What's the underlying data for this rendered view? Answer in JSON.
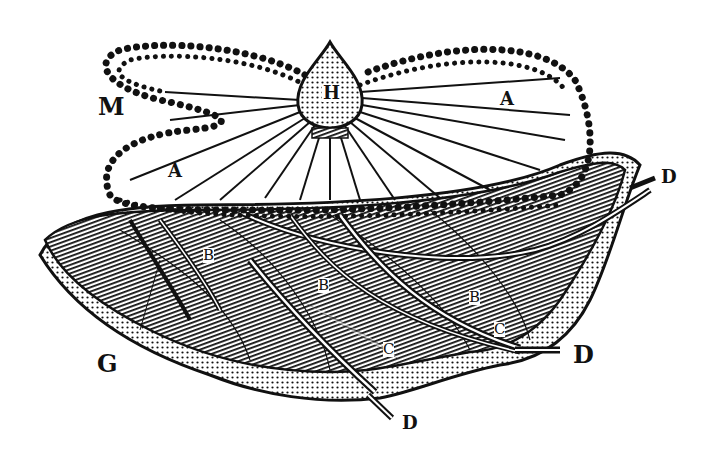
{
  "figure": {
    "type": "engraved anatomical illustration",
    "colors": {
      "ink": "#111111",
      "paper": "#ffffff"
    },
    "labels": {
      "H": "H",
      "M": "M",
      "A_upper": "A",
      "A_lower": "A",
      "G": "G",
      "B_left": "B",
      "B_center": "B",
      "B_right": "B",
      "C_lower": "C",
      "C_right": "C",
      "D_top": "D",
      "D_right": "D",
      "D_bottom": "D"
    }
  }
}
